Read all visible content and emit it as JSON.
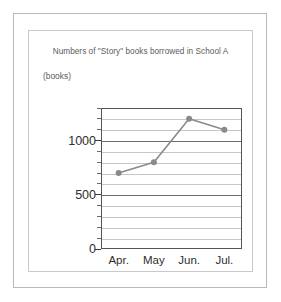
{
  "chart_data": {
    "type": "line",
    "title": "Numbers of \"Story\" books borrowed in School A",
    "xlabel": "",
    "ylabel": "(books)",
    "categories": [
      "Apr.",
      "May",
      "Jun.",
      "Jul."
    ],
    "values": [
      700,
      800,
      1200,
      1100
    ],
    "series": [
      {
        "name": "\"Story\" books borrowed",
        "values": [
          700,
          800,
          1200,
          1100
        ]
      }
    ],
    "ylim": [
      0,
      1300
    ],
    "y_tick_labels": [
      "0",
      "500",
      "1000"
    ],
    "y_tick_values": [
      0,
      500,
      1000
    ],
    "y_minor_interval": 100,
    "grid": true,
    "legend": "none",
    "line_color": "#8a8a8a",
    "marker_color": "#8a8a8a",
    "marker_shape": "circle",
    "axis_color": "#555555",
    "gridline_color": "#c6c6c6",
    "major_gridline_color": "#6e6e6e",
    "background_color": "#ffffff"
  },
  "frame": {
    "outer_border_color": "#b9b9b9",
    "inner_border_color": "#c9c9c9"
  }
}
